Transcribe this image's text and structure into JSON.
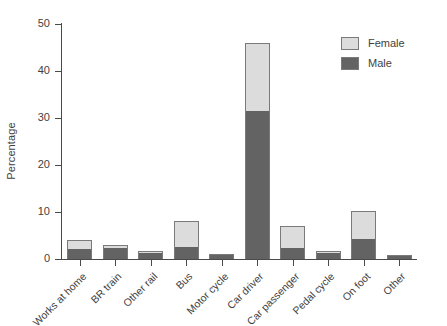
{
  "chart_data": {
    "type": "bar",
    "subtype": "stacked-vertical",
    "title": "",
    "xlabel": "",
    "ylabel": "Percentage",
    "ylim": [
      0,
      50
    ],
    "yticks": [
      0,
      10,
      20,
      30,
      40,
      50
    ],
    "grid": false,
    "legend_position": "top-right",
    "categories": [
      "Works at home",
      "BR train",
      "Other rail",
      "Bus",
      "Motor cycle",
      "Car driver",
      "Car passenger",
      "Pedal cycle",
      "On foot",
      "Other"
    ],
    "series": [
      {
        "name": "Male",
        "color": "#636363",
        "values": [
          2.2,
          2.3,
          1.2,
          2.5,
          1.0,
          31.5,
          2.4,
          1.3,
          4.2,
          0.8
        ]
      },
      {
        "name": "Female",
        "color": "#dcdcdc",
        "values": [
          1.8,
          0.7,
          0.5,
          5.5,
          0.0,
          14.5,
          4.6,
          0.5,
          6.0,
          0.0
        ]
      }
    ],
    "totals": [
      4.0,
      3.0,
      1.7,
      8.0,
      1.0,
      46.0,
      7.0,
      1.8,
      10.2,
      0.8
    ]
  },
  "axis": {
    "y_title": "Percentage",
    "tick_labels": [
      "0",
      "10",
      "20",
      "30",
      "40",
      "50"
    ]
  },
  "legend": {
    "items": [
      {
        "label": "Female",
        "color": "#dcdcdc"
      },
      {
        "label": "Male",
        "color": "#636363"
      }
    ]
  },
  "colors": {
    "female": "#dcdcdc",
    "male": "#636363",
    "axis": "#4a4a4a",
    "bar_outline": "#7a7a7a",
    "text": "#3f3f3f",
    "background": "#ffffff"
  }
}
